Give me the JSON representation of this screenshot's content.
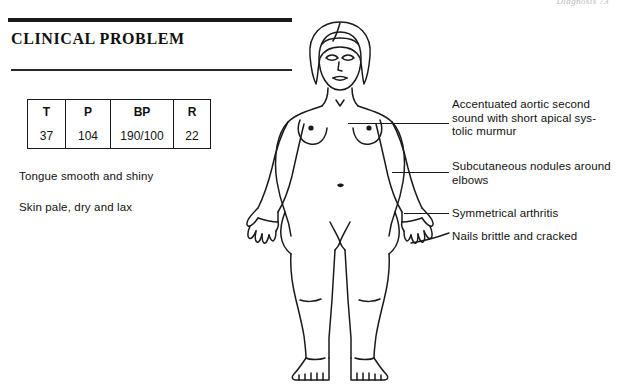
{
  "page": {
    "running_head": "Diagnosis  73",
    "background_color": "#ffffff",
    "ink_color": "#1a1a1a"
  },
  "section": {
    "heading": "CLINICAL PROBLEM"
  },
  "vitals": {
    "columns": [
      "T",
      "P",
      "BP",
      "R"
    ],
    "values": [
      "37",
      "104",
      "190/100",
      "22"
    ]
  },
  "findings": [
    "Tongue smooth and shiny",
    "Skin pale, dry and lax"
  ],
  "annotations": [
    {
      "id": "aortic-sound",
      "lines": [
        "Accentuated aortic second",
        "sound with short apical sys-",
        "tolic murmur"
      ],
      "text": "Accentuated aortic second sound with short apical systolic murmur"
    },
    {
      "id": "subcutaneous-nodules",
      "lines": [
        "Subcutaneous nodules around",
        "elbows"
      ],
      "text": "Subcutaneous nodules around elbows"
    },
    {
      "id": "symmetrical-arthritis",
      "lines": [
        "Symmetrical arthritis"
      ],
      "text": "Symmetrical arthritis"
    },
    {
      "id": "nails-brittle",
      "lines": [
        "Nails brittle and cracked"
      ],
      "text": "Nails brittle and cracked"
    }
  ],
  "figure": {
    "name": "anterior-female-body-diagram"
  }
}
